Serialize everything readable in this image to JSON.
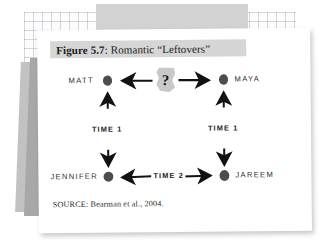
{
  "figure": {
    "title_prefix": "Figure 5.7",
    "title_rest": ": Romantic “Leftovers”",
    "source": "SOURCE: Bearman et al., 2004."
  },
  "diagram": {
    "type": "node-link",
    "unknown_marker": "?",
    "nodes": [
      {
        "id": "matt",
        "label": "MATT",
        "position": "top-left"
      },
      {
        "id": "maya",
        "label": "MAYA",
        "position": "top-right"
      },
      {
        "id": "jennifer",
        "label": "JENNIFER",
        "position": "bottom-left"
      },
      {
        "id": "jareem",
        "label": "JAREEM",
        "position": "bottom-right"
      }
    ],
    "edges": [
      {
        "id": "q-to-matt",
        "from": "?",
        "to": "matt",
        "label": "",
        "arrow": "single",
        "orientation": "horizontal"
      },
      {
        "id": "q-to-maya",
        "from": "?",
        "to": "maya",
        "label": "",
        "arrow": "single",
        "orientation": "horizontal"
      },
      {
        "id": "matt-jennifer",
        "from": "matt",
        "to": "jennifer",
        "label": "TIME 1",
        "arrow": "double",
        "orientation": "vertical"
      },
      {
        "id": "maya-jareem",
        "from": "maya",
        "to": "jareem",
        "label": "TIME 1",
        "arrow": "double",
        "orientation": "vertical"
      },
      {
        "id": "jennifer-jareem",
        "from": "jennifer",
        "to": "jareem",
        "label": "TIME 2",
        "arrow": "double",
        "orientation": "horizontal"
      }
    ],
    "labels": {
      "time1_left": "TIME 1",
      "time1_right": "TIME 1",
      "time2_bottom": "TIME 2"
    }
  },
  "colors": {
    "card_background": "#ffffff",
    "title_band": "#d6d6d6",
    "node_dot": "#4a4a4a",
    "ink": "#151515",
    "gray_strip": "#a8a8a8",
    "grid_line": "#96a0af"
  }
}
